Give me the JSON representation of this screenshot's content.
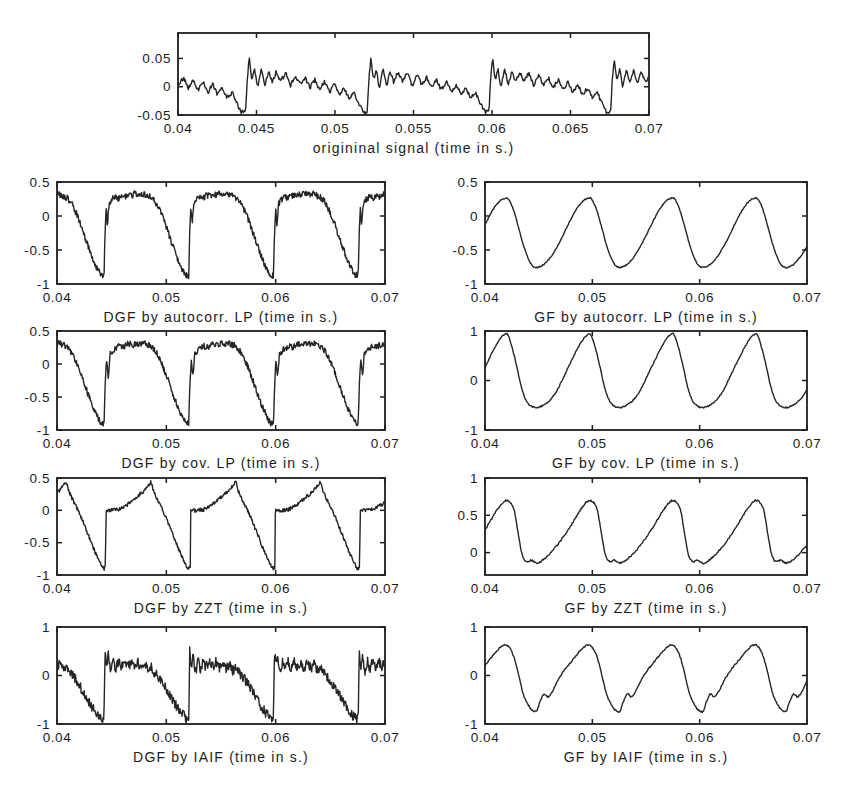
{
  "figure": {
    "background_color": "#ffffff",
    "axis_color": "#1f1f1f",
    "line_color": "#252525",
    "text_color": "#1c1c1c",
    "width_px": 845,
    "height_px": 796,
    "glottal_closure_instants_s": [
      0.0443,
      0.052,
      0.0598,
      0.0675
    ],
    "fundamental_period_s": 0.00775
  },
  "chart_data": [
    {
      "id": "original-signal",
      "type": "line",
      "title": "",
      "xlabel": "origininal signal (time in s.)",
      "xlim": [
        0.04,
        0.07
      ],
      "xtick_values": [
        0.04,
        0.045,
        0.05,
        0.055,
        0.06,
        0.065,
        0.07
      ],
      "xtick_labels": [
        "0.04",
        "0.045",
        "0.05",
        "0.055",
        "0.06",
        "0.065",
        "0.07"
      ],
      "ylim": [
        -0.05,
        0.095
      ],
      "ytick_values": [
        0.05,
        0,
        -0.05
      ],
      "ytick_labels": [
        "0.05",
        "0",
        "-0.05"
      ],
      "grid": false,
      "legend": null,
      "period_s": 0.00775,
      "t0_s": 0.0443,
      "period_phase": [
        0,
        0.013,
        0.03,
        0.05,
        0.075,
        0.1,
        0.13,
        0.16,
        0.19,
        0.22,
        0.25,
        0.29,
        0.33,
        0.37,
        0.41,
        0.45,
        0.49,
        0.53,
        0.57,
        0.61,
        0.65,
        0.69,
        0.73,
        0.77,
        0.81,
        0.85,
        0.89,
        0.93,
        0.965,
        1
      ],
      "period_value": [
        -0.045,
        0.008,
        0.053,
        0.012,
        0.03,
        -0.002,
        0.032,
        0.004,
        0.028,
        0.007,
        0.026,
        0.01,
        0.024,
        0.002,
        0.02,
        0.004,
        0.016,
        -0.002,
        0.013,
        -0.006,
        0.01,
        -0.01,
        0.004,
        -0.014,
        -0.002,
        -0.02,
        -0.01,
        -0.03,
        -0.044,
        -0.045
      ],
      "noise_amplitude": 0.0035,
      "noise_seed": 11,
      "smooth": false,
      "layout": {
        "box_left": 178,
        "box_top": 33,
        "box_width": 471,
        "box_height": 82
      }
    },
    {
      "id": "dgf-autocorr-lp",
      "type": "line",
      "title": "",
      "xlabel": "DGF by autocorr. LP (time in s.)",
      "xlim": [
        0.04,
        0.07
      ],
      "xtick_values": [
        0.04,
        0.05,
        0.06,
        0.07
      ],
      "xtick_labels": [
        "0.04",
        "0.05",
        "0.06",
        "0.07"
      ],
      "ylim": [
        -1,
        0.5
      ],
      "ytick_values": [
        0.5,
        0,
        -0.5,
        -1
      ],
      "ytick_labels": [
        "0.5",
        "0",
        "-0.5",
        "-1"
      ],
      "grid": false,
      "legend": null,
      "period_s": 0.00775,
      "t0_s": 0.0443,
      "period_phase": [
        0,
        0.012,
        0.025,
        0.04,
        0.06,
        0.09,
        0.13,
        0.17,
        0.21,
        0.25,
        0.29,
        0.33,
        0.37,
        0.41,
        0.45,
        0.49,
        0.53,
        0.57,
        0.62,
        0.68,
        0.74,
        0.8,
        0.86,
        0.92,
        0.97,
        1
      ],
      "period_value": [
        -0.88,
        -0.25,
        0.1,
        -0.12,
        0.18,
        0.24,
        0.28,
        0.26,
        0.31,
        0.29,
        0.33,
        0.3,
        0.34,
        0.31,
        0.33,
        0.31,
        0.29,
        0.26,
        0.18,
        0.02,
        -0.18,
        -0.4,
        -0.6,
        -0.78,
        -0.87,
        -0.88
      ],
      "noise_amplitude": 0.045,
      "noise_seed": 21,
      "smooth": false,
      "layout": {
        "box_left": 57,
        "box_top": 182,
        "box_width": 328,
        "box_height": 102
      }
    },
    {
      "id": "gf-autocorr-lp",
      "type": "line",
      "title": "",
      "xlabel": "GF  by autocorr. LP (time in s.)",
      "xlim": [
        0.04,
        0.07
      ],
      "xtick_values": [
        0.04,
        0.05,
        0.06,
        0.07
      ],
      "xtick_labels": [
        "0.04",
        "0.05",
        "0.06",
        "0.07"
      ],
      "ylim": [
        -1,
        0.5
      ],
      "ytick_values": [
        0.5,
        0,
        -0.5,
        -1
      ],
      "ytick_labels": [
        "0.5",
        "0",
        "-0.5",
        "-1"
      ],
      "grid": false,
      "legend": null,
      "period_s": 0.00775,
      "t0_s": 0.0448,
      "period_phase": [
        0,
        0.08,
        0.16,
        0.24,
        0.32,
        0.4,
        0.48,
        0.56,
        0.62,
        0.66,
        0.72,
        0.78,
        0.84,
        0.9,
        0.95,
        1
      ],
      "period_value": [
        -0.76,
        -0.72,
        -0.62,
        -0.47,
        -0.28,
        -0.08,
        0.1,
        0.22,
        0.26,
        0.25,
        0.1,
        -0.15,
        -0.42,
        -0.62,
        -0.73,
        -0.76
      ],
      "noise_amplitude": 0.008,
      "noise_seed": 31,
      "smooth": true,
      "layout": {
        "box_left": 485,
        "box_top": 182,
        "box_width": 322,
        "box_height": 102
      }
    },
    {
      "id": "dgf-cov-lp",
      "type": "line",
      "title": "",
      "xlabel": "DGF by cov. LP (time in s.)",
      "xlim": [
        0.04,
        0.07
      ],
      "xtick_values": [
        0.04,
        0.05,
        0.06,
        0.07
      ],
      "xtick_labels": [
        "0.04",
        "0.05",
        "0.06",
        "0.07"
      ],
      "ylim": [
        -1,
        0.5
      ],
      "ytick_values": [
        0.5,
        0,
        -0.5,
        -1
      ],
      "ytick_labels": [
        "0.5",
        "0",
        "-0.5",
        "-1"
      ],
      "grid": false,
      "legend": null,
      "period_s": 0.00775,
      "t0_s": 0.0443,
      "period_phase": [
        0,
        0.012,
        0.03,
        0.05,
        0.07,
        0.1,
        0.14,
        0.18,
        0.22,
        0.26,
        0.3,
        0.34,
        0.38,
        0.42,
        0.46,
        0.5,
        0.54,
        0.58,
        0.63,
        0.69,
        0.75,
        0.81,
        0.87,
        0.93,
        0.97,
        1
      ],
      "period_value": [
        -0.9,
        -0.35,
        0.05,
        -0.2,
        0.15,
        0.2,
        0.24,
        0.27,
        0.25,
        0.29,
        0.31,
        0.28,
        0.32,
        0.3,
        0.33,
        0.3,
        0.28,
        0.24,
        0.15,
        -0.02,
        -0.22,
        -0.45,
        -0.65,
        -0.82,
        -0.9,
        -0.9
      ],
      "noise_amplitude": 0.045,
      "noise_seed": 41,
      "smooth": false,
      "layout": {
        "box_left": 57,
        "box_top": 331,
        "box_width": 328,
        "box_height": 99
      }
    },
    {
      "id": "gf-cov-lp",
      "type": "line",
      "title": "",
      "xlabel": "GF by  cov. LP (time in s.)",
      "xlim": [
        0.04,
        0.07
      ],
      "xtick_values": [
        0.04,
        0.05,
        0.06,
        0.07
      ],
      "xtick_labels": [
        "0.04",
        "0.05",
        "0.06",
        "0.07"
      ],
      "ylim": [
        -1,
        1
      ],
      "ytick_values": [
        1,
        0,
        -1
      ],
      "ytick_labels": [
        "1",
        "0",
        "-1"
      ],
      "grid": false,
      "legend": null,
      "period_s": 0.00775,
      "t0_s": 0.0448,
      "period_phase": [
        0,
        0.08,
        0.16,
        0.24,
        0.32,
        0.4,
        0.48,
        0.56,
        0.61,
        0.65,
        0.7,
        0.76,
        0.82,
        0.88,
        0.94,
        1
      ],
      "period_value": [
        -0.55,
        -0.5,
        -0.4,
        -0.22,
        0.05,
        0.33,
        0.6,
        0.83,
        0.92,
        0.93,
        0.7,
        0.3,
        -0.15,
        -0.42,
        -0.52,
        -0.55
      ],
      "noise_amplitude": 0.012,
      "noise_seed": 51,
      "smooth": true,
      "layout": {
        "box_left": 485,
        "box_top": 331,
        "box_width": 322,
        "box_height": 99
      }
    },
    {
      "id": "dgf-zzt",
      "type": "line",
      "title": "",
      "xlabel": "DGF by ZZT (time in s.)",
      "xlim": [
        0.04,
        0.07
      ],
      "xtick_values": [
        0.04,
        0.05,
        0.06,
        0.07
      ],
      "xtick_labels": [
        "0.04",
        "0.05",
        "0.06",
        "0.07"
      ],
      "ylim": [
        -1,
        0.5
      ],
      "ytick_values": [
        0.5,
        0,
        -0.5,
        -1
      ],
      "ytick_labels": [
        "0.5",
        "0",
        "-0.5",
        "-1"
      ],
      "grid": false,
      "legend": null,
      "period_s": 0.00775,
      "t0_s": 0.0443,
      "period_phase": [
        0,
        0.018,
        0.022,
        0.09,
        0.17,
        0.23,
        0.29,
        0.35,
        0.41,
        0.47,
        0.52,
        0.555,
        0.59,
        0.64,
        0.7,
        0.76,
        0.82,
        0.88,
        0.94,
        0.98,
        1
      ],
      "period_value": [
        -0.9,
        -0.88,
        0.0,
        0.0,
        0.01,
        0.05,
        0.1,
        0.17,
        0.23,
        0.3,
        0.38,
        0.44,
        0.28,
        0.14,
        -0.02,
        -0.2,
        -0.4,
        -0.6,
        -0.78,
        -0.88,
        -0.9
      ],
      "noise_amplitude": 0.028,
      "noise_seed": 61,
      "smooth": false,
      "layout": {
        "box_left": 57,
        "box_top": 478,
        "box_width": 328,
        "box_height": 97
      }
    },
    {
      "id": "gf-zzt",
      "type": "line",
      "title": "",
      "xlabel": "GF by ZZT (time in s.)",
      "xlim": [
        0.04,
        0.07
      ],
      "xtick_values": [
        1.0,
        0.05,
        0.06,
        0.07
      ],
      "xtick_labels": [
        "0.04",
        "0.05",
        "0.06",
        "0.07"
      ],
      "ylim": [
        -0.3,
        1
      ],
      "ytick_values": [
        1,
        0.5,
        0
      ],
      "ytick_labels": [
        "1",
        "0.5",
        "0"
      ],
      "grid": false,
      "legend": null,
      "period_s": 0.00775,
      "t0_s": 0.0443,
      "period_phase": [
        0,
        0.07,
        0.14,
        0.22,
        0.3,
        0.38,
        0.46,
        0.54,
        0.61,
        0.67,
        0.71,
        0.76,
        0.8,
        0.84,
        0.89,
        0.94,
        1
      ],
      "period_value": [
        -0.1,
        -0.14,
        -0.1,
        -0.02,
        0.08,
        0.2,
        0.33,
        0.48,
        0.6,
        0.68,
        0.7,
        0.66,
        0.55,
        0.28,
        -0.02,
        -0.12,
        -0.1
      ],
      "noise_amplitude": 0.01,
      "noise_seed": 71,
      "smooth": true,
      "layout": {
        "box_left": 485,
        "box_top": 478,
        "box_width": 322,
        "box_height": 97
      }
    },
    {
      "id": "dgf-iaif",
      "type": "line",
      "title": "",
      "xlabel": "DGF by IAIF (time in s.)",
      "xlim": [
        0.04,
        0.07
      ],
      "xtick_values": [
        0.04,
        0.05,
        0.06,
        0.07
      ],
      "xtick_labels": [
        "0.04",
        "0.05",
        "0.06",
        "0.07"
      ],
      "ylim": [
        -1,
        1
      ],
      "ytick_values": [
        1,
        0,
        -1
      ],
      "ytick_labels": [
        "1",
        "0",
        "-1"
      ],
      "grid": false,
      "legend": null,
      "period_s": 0.00775,
      "t0_s": 0.0443,
      "period_phase": [
        0,
        0.012,
        0.03,
        0.05,
        0.08,
        0.11,
        0.14,
        0.17,
        0.2,
        0.24,
        0.28,
        0.32,
        0.36,
        0.4,
        0.44,
        0.48,
        0.52,
        0.56,
        0.6,
        0.65,
        0.7,
        0.75,
        0.8,
        0.85,
        0.9,
        0.95,
        0.98,
        1
      ],
      "period_value": [
        -0.9,
        0.55,
        0.2,
        0.42,
        0.05,
        0.32,
        0.1,
        0.3,
        0.15,
        0.3,
        0.18,
        0.28,
        0.16,
        0.27,
        0.14,
        0.24,
        0.1,
        0.18,
        0.05,
        -0.05,
        -0.18,
        -0.32,
        -0.48,
        -0.62,
        -0.75,
        -0.85,
        -0.9,
        -0.9
      ],
      "noise_amplitude": 0.1,
      "noise_seed": 81,
      "smooth": false,
      "layout": {
        "box_left": 57,
        "box_top": 627,
        "box_width": 328,
        "box_height": 97
      }
    },
    {
      "id": "gf-iaif",
      "type": "line",
      "title": "",
      "xlabel": "GF by IAIF (time in s.)",
      "xlim": [
        0.04,
        0.07
      ],
      "xtick_values": [
        0.04,
        0.05,
        0.06,
        0.07
      ],
      "xtick_labels": [
        "0.04",
        "0.05",
        "0.06",
        "0.07"
      ],
      "ylim": [
        -1,
        1
      ],
      "ytick_values": [
        1,
        0,
        -1
      ],
      "ytick_labels": [
        "1",
        "0",
        "-1"
      ],
      "grid": false,
      "legend": null,
      "period_s": 0.00775,
      "t0_s": 0.0448,
      "period_phase": [
        0,
        0.04,
        0.09,
        0.14,
        0.19,
        0.25,
        0.32,
        0.4,
        0.48,
        0.56,
        0.62,
        0.66,
        0.72,
        0.78,
        0.84,
        0.9,
        0.95,
        1
      ],
      "period_value": [
        -0.75,
        -0.55,
        -0.38,
        -0.44,
        -0.33,
        -0.12,
        0.08,
        0.25,
        0.42,
        0.57,
        0.63,
        0.6,
        0.42,
        0.05,
        -0.38,
        -0.6,
        -0.72,
        -0.75
      ],
      "noise_amplitude": 0.015,
      "noise_seed": 91,
      "smooth": true,
      "layout": {
        "box_left": 485,
        "box_top": 627,
        "box_width": 322,
        "box_height": 97
      }
    }
  ]
}
